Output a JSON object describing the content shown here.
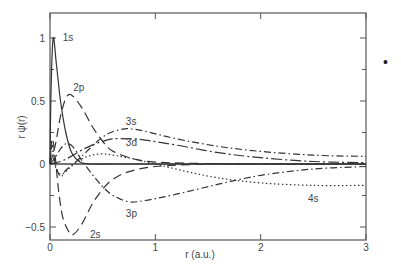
{
  "chart_data": {
    "type": "line",
    "title": "",
    "xlabel": "r (a.u.)",
    "ylabel": "r ψ(r)",
    "xlim": [
      0,
      3
    ],
    "ylim": [
      -0.6,
      1.2
    ],
    "xticks": [
      0,
      1,
      2,
      3
    ],
    "xtick_labels": [
      "0",
      "1",
      "2",
      "3"
    ],
    "yticks": [
      -0.5,
      0,
      0.5,
      1
    ],
    "ytick_labels": [
      "−0.5",
      "0",
      "0.5",
      "1"
    ],
    "grid": false,
    "legend": "inline curve labels",
    "series": [
      {
        "name": "1s",
        "style": "solid",
        "x": [
          0,
          0.01,
          0.03,
          0.06,
          0.1,
          0.15,
          0.2,
          0.25,
          0.3,
          0.4,
          0.6,
          1.0,
          3.0
        ],
        "y": [
          0,
          0.6,
          1.0,
          0.8,
          0.5,
          0.25,
          0.1,
          0.04,
          0.01,
          0,
          0,
          0,
          0
        ]
      },
      {
        "name": "2p",
        "style": "long-dash",
        "x": [
          0,
          0.05,
          0.1,
          0.15,
          0.2,
          0.3,
          0.4,
          0.5,
          0.6,
          0.8,
          1.0,
          1.5,
          2.0,
          3.0
        ],
        "y": [
          0,
          0.15,
          0.38,
          0.52,
          0.55,
          0.45,
          0.3,
          0.18,
          0.1,
          0.04,
          0.015,
          0.003,
          0,
          0
        ]
      },
      {
        "name": "2s",
        "style": "long-dash",
        "x": [
          0,
          0.02,
          0.05,
          0.08,
          0.12,
          0.18,
          0.22,
          0.3,
          0.4,
          0.5,
          0.6,
          0.75,
          1.0,
          1.5,
          2.0,
          3.0
        ],
        "y": [
          0,
          0.2,
          0.05,
          -0.2,
          -0.42,
          -0.54,
          -0.56,
          -0.48,
          -0.32,
          -0.2,
          -0.12,
          -0.06,
          -0.02,
          0,
          0,
          0
        ]
      },
      {
        "name": "3s",
        "style": "dash-dot",
        "x": [
          0,
          0.02,
          0.05,
          0.1,
          0.15,
          0.25,
          0.35,
          0.45,
          0.55,
          0.65,
          0.75,
          0.9,
          1.2,
          1.6,
          2.0,
          2.5,
          3.0
        ],
        "y": [
          0,
          0.15,
          0.0,
          -0.1,
          -0.05,
          0.02,
          0.1,
          0.18,
          0.24,
          0.27,
          0.28,
          0.26,
          0.2,
          0.14,
          0.1,
          0.07,
          0.06
        ]
      },
      {
        "name": "3d",
        "style": "dash-dot-long",
        "x": [
          0,
          0.1,
          0.2,
          0.3,
          0.4,
          0.5,
          0.6,
          0.75,
          0.9,
          1.2,
          1.6,
          2.0,
          2.5,
          3.0
        ],
        "y": [
          0,
          0.02,
          0.06,
          0.11,
          0.15,
          0.18,
          0.2,
          0.2,
          0.19,
          0.15,
          0.09,
          0.05,
          0.02,
          0.01
        ]
      },
      {
        "name": "3p",
        "style": "dash-dot",
        "x": [
          0,
          0.05,
          0.1,
          0.15,
          0.2,
          0.25,
          0.3,
          0.4,
          0.5,
          0.6,
          0.75,
          0.9,
          1.2,
          1.6,
          2.0,
          2.5,
          3.0
        ],
        "y": [
          0,
          0.05,
          0.12,
          0.16,
          0.15,
          0.1,
          0.03,
          -0.08,
          -0.18,
          -0.25,
          -0.3,
          -0.29,
          -0.24,
          -0.16,
          -0.09,
          -0.04,
          -0.02
        ]
      },
      {
        "name": "4s",
        "style": "dotted",
        "x": [
          0,
          0.02,
          0.05,
          0.1,
          0.15,
          0.2,
          0.3,
          0.4,
          0.5,
          0.6,
          0.8,
          1.0,
          1.3,
          1.6,
          2.0,
          2.5,
          3.0
        ],
        "y": [
          0,
          0.1,
          -0.02,
          -0.08,
          -0.06,
          -0.02,
          0.04,
          0.07,
          0.08,
          0.07,
          0.04,
          0.0,
          -0.06,
          -0.11,
          -0.15,
          -0.17,
          -0.17
        ]
      }
    ],
    "annotations": [
      {
        "text": "1s",
        "x": 0.12,
        "y": 1.0
      },
      {
        "text": "2p",
        "x": 0.22,
        "y": 0.6
      },
      {
        "text": "3s",
        "x": 0.72,
        "y": 0.33
      },
      {
        "text": "3d",
        "x": 0.72,
        "y": 0.17
      },
      {
        "text": "3p",
        "x": 0.72,
        "y": -0.4
      },
      {
        "text": "2s",
        "x": 0.38,
        "y": -0.56
      },
      {
        "text": "4s",
        "x": 2.45,
        "y": -0.28
      }
    ]
  },
  "page": {
    "bullet": "•"
  }
}
